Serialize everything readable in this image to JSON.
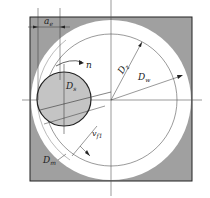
{
  "diagram": {
    "type": "mechanical-section",
    "colors": {
      "background": "#ffffff",
      "housing_fill": "#a0a0a0",
      "bore_fill": "#ffffff",
      "wheel_fill": "#c4c4c4",
      "line": "#333333"
    },
    "labels": {
      "ae": "a",
      "ae_sub": "e",
      "n": "n",
      "ds": "D",
      "ds_sub": "s",
      "dz": "D",
      "dz_sub": "z",
      "dw": "D",
      "dw_sub": "w",
      "vf": "v",
      "vf_sub": "f1",
      "dm": "D",
      "dm_sub": "m"
    }
  }
}
